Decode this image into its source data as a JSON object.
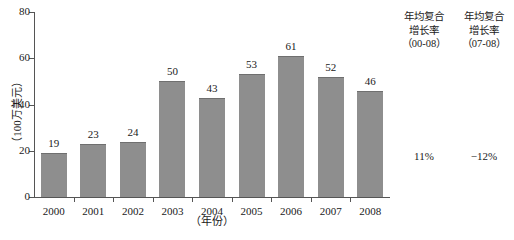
{
  "chart_data": {
    "type": "bar",
    "title": "",
    "subtitle": "",
    "xlabel": "（年份）",
    "ylabel": "（100万美元）",
    "categories": [
      "2000",
      "2001",
      "2002",
      "2003",
      "2004",
      "2005",
      "2006",
      "2007",
      "2008"
    ],
    "values": [
      19,
      23,
      24,
      50,
      43,
      53,
      61,
      52,
      46
    ],
    "ylim": [
      0,
      80
    ],
    "yticks": [
      0,
      20,
      40,
      60,
      80
    ],
    "ytick_labels": [
      "0",
      "20",
      "40",
      "60",
      "80"
    ],
    "grid": false,
    "legend": "none",
    "bar_color": "#8e8e8e",
    "bar_edge_color": "#6f6f6f",
    "axis_color": "#555555",
    "annotations": [
      {
        "header_lines": [
          "年均复合",
          "增长率",
          "（00-08）"
        ],
        "value": "11%"
      },
      {
        "header_lines": [
          "年均复合",
          "增长率",
          "（07-08）"
        ],
        "value": "−12%"
      }
    ]
  }
}
